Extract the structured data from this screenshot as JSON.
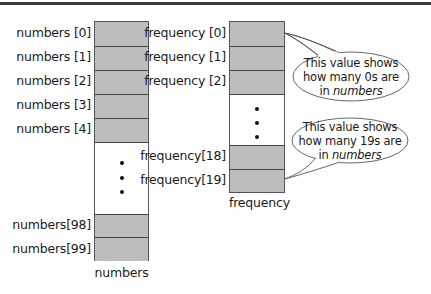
{
  "numbers_array": {
    "caption": "numbers",
    "top_labels": [
      "numbers [0]",
      "numbers [1]",
      "numbers [2]",
      "numbers [3]",
      "numbers [4]"
    ],
    "bottom_labels": [
      "numbers[98]",
      "numbers[99]"
    ],
    "ellipsis": "..."
  },
  "frequency_array": {
    "caption": "frequency",
    "top_labels": [
      "frequency [0]",
      "frequency [1]",
      "frequency [2]"
    ],
    "bottom_labels": [
      "frequency[18]",
      "frequency[19]"
    ],
    "ellipsis": "..."
  },
  "callouts": [
    {
      "line1": "This value shows",
      "line2": "how many 0s are",
      "line3_prefix": "in ",
      "line3_italic": "numbers",
      "points_to": "frequency [0]"
    },
    {
      "line1": "This value shows",
      "line2": "how many 19s are",
      "line3_prefix": "in ",
      "line3_italic": "numbers",
      "points_to": "frequency[19]"
    }
  ],
  "colors": {
    "cell_fill": "#bdbdbd",
    "cell_border": "#444444",
    "top_rule": "#3a3a3a",
    "background": "#ffffff"
  }
}
